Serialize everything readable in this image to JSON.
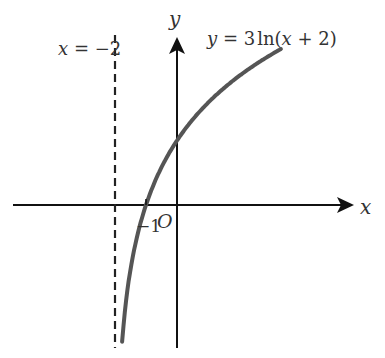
{
  "chart_data": {
    "type": "line",
    "title": "",
    "function_label": "y = 3ln(x + 2)",
    "function_label_parts": {
      "y": "y",
      "eq": " = 3",
      "ln": "ln",
      "open": "(",
      "x": "x",
      "rest": " + 2",
      "close": ")"
    },
    "asymptote_label": "x = −2",
    "asymptote_label_parts": {
      "x": "x",
      "rest": " = −2"
    },
    "asymptote_x": -2,
    "xlabel": "x",
    "ylabel": "y",
    "origin_label": "O",
    "tick_labels": [
      {
        "x": -1,
        "label": "−1"
      }
    ],
    "x_intercept": -1,
    "y_intercept": 2.08,
    "xlim": [
      -5.4,
      5.8
    ],
    "ylim": [
      -4.6,
      5.9
    ],
    "grid": false,
    "legend": "none",
    "series": [
      {
        "name": "y = 3ln(x + 2)",
        "x": [
          -1.77,
          -1.6,
          -1.4,
          -1.2,
          -1.0,
          -0.5,
          0,
          0.5,
          1.0,
          1.5,
          2.0,
          2.5,
          3.0,
          3.35
        ],
        "values": [
          -4.41,
          -2.75,
          -1.53,
          -0.67,
          0,
          1.22,
          2.08,
          2.75,
          3.3,
          3.76,
          4.16,
          4.51,
          4.83,
          5.03
        ]
      }
    ],
    "colors": {
      "curve": "#555555",
      "axes": "#111111",
      "asymptote": "#222222",
      "text": "#333333"
    }
  }
}
